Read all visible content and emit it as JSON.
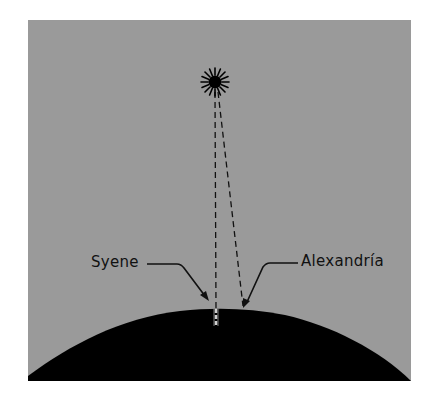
{
  "diagram": {
    "colors": {
      "background": "#9a9a9a",
      "earth": "#000000",
      "sun": "#000000",
      "page": "#ffffff"
    },
    "labels": {
      "syene": "Syene",
      "alexandria": "Alexandría"
    },
    "elements": {
      "sun": "sun-icon",
      "earth": "earth-dome",
      "well": "well-shaft"
    }
  }
}
